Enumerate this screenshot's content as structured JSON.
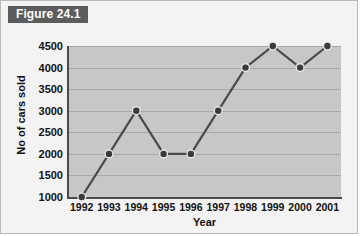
{
  "figure": {
    "tab_label": "Figure 24.1"
  },
  "colors": {
    "tab_background": "#5c5c5c",
    "tab_text": "#ffffff",
    "page_background": "#f3f3f3",
    "plot_background": "#c7c7c7",
    "gridline": "#a9a9a9",
    "axis": "#4a4a4a",
    "series_line": "#4a4a4a",
    "marker_fill": "#3a3a3a",
    "marker_halo": "#e6e6e6"
  },
  "chart_data": {
    "type": "line",
    "title": "Figure 24.1",
    "xlabel": "Year",
    "ylabel": "No of cars sold",
    "categories": [
      "1992",
      "1993",
      "1994",
      "1995",
      "1996",
      "1997",
      "1998",
      "1999",
      "2000",
      "2001"
    ],
    "values": [
      1000,
      2000,
      3000,
      2000,
      2000,
      3000,
      4000,
      4500,
      4000,
      4500
    ],
    "ylim": [
      1000,
      4500
    ],
    "ytick_labels": [
      "4500",
      "4000",
      "3500",
      "3000",
      "2500",
      "2000",
      "1500",
      "1000"
    ],
    "ytick_values": [
      4500,
      4000,
      3500,
      3000,
      2500,
      2000,
      1500,
      1000
    ],
    "grid": true,
    "legend": false,
    "markers": "circle"
  }
}
